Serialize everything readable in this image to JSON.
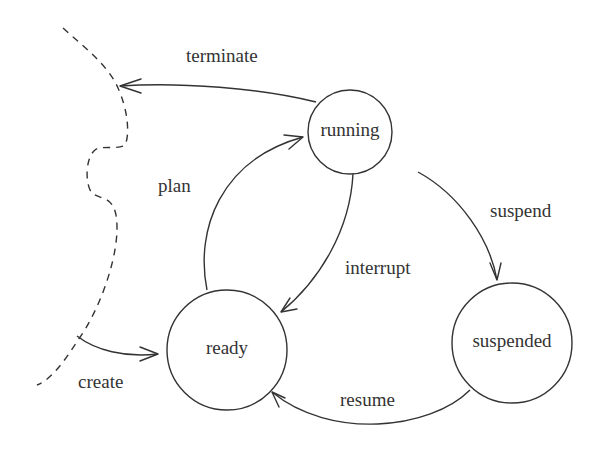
{
  "diagram": {
    "type": "state-transition-diagram",
    "colors": {
      "stroke": "#333333",
      "text": "#333333",
      "background": "#ffffff"
    },
    "states": [
      {
        "id": "running",
        "label": "running"
      },
      {
        "id": "ready",
        "label": "ready"
      },
      {
        "id": "suspended",
        "label": "suspended"
      }
    ],
    "transitions": [
      {
        "id": "terminate",
        "label": "terminate",
        "from": "running",
        "to": "outside"
      },
      {
        "id": "plan",
        "label": "plan",
        "from": "ready",
        "to": "running"
      },
      {
        "id": "interrupt",
        "label": "interrupt",
        "from": "running",
        "to": "ready"
      },
      {
        "id": "suspend",
        "label": "suspend",
        "from": "running",
        "to": "suspended"
      },
      {
        "id": "resume",
        "label": "resume",
        "from": "suspended",
        "to": "ready"
      },
      {
        "id": "create",
        "label": "create",
        "from": "outside",
        "to": "ready"
      }
    ]
  }
}
